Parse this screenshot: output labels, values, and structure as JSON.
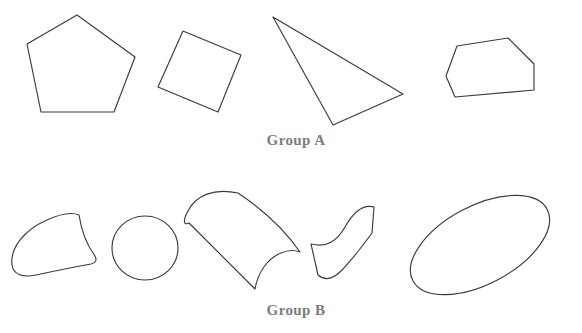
{
  "figure": {
    "background_color": "#ffffff",
    "stroke_color": "#3b3b3f",
    "label_color": "#7c7c7c",
    "width": 582,
    "height": 333
  },
  "groups": [
    {
      "id": "group-a",
      "label": "Group A",
      "description": "polygons with straight sides",
      "shapes": [
        {
          "name": "pentagon",
          "kind": "polygon",
          "points": "77,15 135,57 114,112 41,112 27,44"
        },
        {
          "name": "tilted-square",
          "kind": "polygon",
          "points": "183,31 241,55 218,112 158,87"
        },
        {
          "name": "scalene-triangle",
          "kind": "polygon",
          "points": "273,17 403,94 333,125"
        },
        {
          "name": "irregular-hexagon",
          "kind": "polygon",
          "points": "457,46 508,38 534,64 534,90 455,97 446,76"
        }
      ]
    },
    {
      "id": "group-b",
      "label": "Group B",
      "description": "shapes with at least one curved side",
      "shapes": [
        {
          "name": "curved-blob",
          "kind": "path",
          "d": "M 13,263 C 16,236 40,220 68,215 C 83,213 86,216 86,222 C 88,239 92,252 96,261 C 78,266 52,272 38,274 C 26,275 12,273 13,263 Z"
        },
        {
          "name": "circle",
          "kind": "ellipse",
          "cx": 145,
          "cy": 248,
          "rx": 33,
          "ry": 32,
          "rotation": 0
        },
        {
          "name": "curved-cylinder",
          "kind": "path",
          "d": "M 236,194 C 212,190 193,200 186,216 C 182,226 185,233 190,224 L 254,288 C 266,262 281,250 300,252 C 290,237 268,216 236,194 Z"
        },
        {
          "name": "wavy-s-shape",
          "kind": "path",
          "d": "M 313,245 C 330,248 340,240 348,226 C 357,211 365,205 375,207 L 371,232 C 359,248 347,262 338,272 C 331,279 324,281 318,276 Z"
        },
        {
          "name": "tilted-ellipse",
          "kind": "ellipse",
          "cx": 480,
          "cy": 245,
          "rx": 76,
          "ry": 39,
          "rotation": -28
        }
      ]
    }
  ]
}
